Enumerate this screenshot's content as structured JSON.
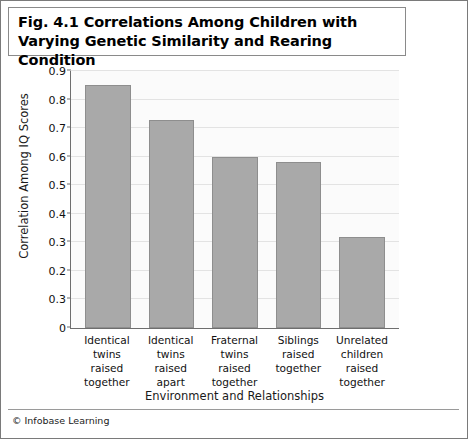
{
  "figure": {
    "title": "Fig. 4.1 Correlations Among Children with Varying Genetic Similarity and Rearing Condition",
    "credit": "© Infobase Learning"
  },
  "chart_data": {
    "type": "bar",
    "title": "Fig. 4.1 Correlations Among Children with Varying Genetic Similarity and Rearing Condition",
    "xlabel": "Environment and Relationships",
    "ylabel": "Correlation Among IQ Scores",
    "categories": [
      "Identical twins raised together",
      "Identical twins raised apart",
      "Fraternal twins raised together",
      "Siblings raised together",
      "Unrelated children raised together"
    ],
    "category_lines": [
      [
        "Identical",
        "twins raised",
        "together"
      ],
      [
        "Identical",
        "twins raised",
        "apart"
      ],
      [
        "Fraternal",
        "twins raised",
        "together"
      ],
      [
        "Siblings",
        "raised",
        "together"
      ],
      [
        "Unrelated",
        "children raised",
        "together"
      ]
    ],
    "values": [
      0.85,
      0.73,
      0.6,
      0.58,
      0.32
    ],
    "ylim": [
      0,
      0.9
    ],
    "ytick_values": [
      0,
      0.1,
      0.2,
      0.3,
      0.4,
      0.5,
      0.6,
      0.7,
      0.8,
      0.9
    ],
    "ytick_labels": [
      "0",
      "0.3",
      "0.2",
      "0.3",
      "0.4",
      "0.5",
      "0.6",
      "0.7",
      "0.8",
      "0.9"
    ],
    "grid": true,
    "legend": false,
    "bar_color": "#a9a9a9",
    "bar_border_color": "#8e8e8e",
    "plot_background": "#fbfbfb"
  }
}
